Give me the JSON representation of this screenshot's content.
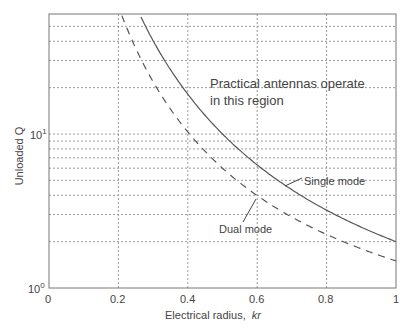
{
  "chart_data": {
    "type": "line",
    "title": "",
    "xlabel": "Electrical radius,",
    "xlabel_italic": "kr",
    "ylabel": "Unloaded Q",
    "xlim": [
      0,
      1
    ],
    "ylim": [
      1,
      60
    ],
    "yscale": "log",
    "grid": true,
    "x_ticks": [
      "0",
      "0.2",
      "0.4",
      "0.6",
      "0.8",
      "1"
    ],
    "y_ticks": [
      {
        "base": "10",
        "exp": "0"
      },
      {
        "base": "10",
        "exp": "1"
      }
    ],
    "series": [
      {
        "name": "Single mode",
        "style": "solid",
        "x": [
          0.21,
          0.25,
          0.3,
          0.35,
          0.4,
          0.45,
          0.5,
          0.6,
          0.7,
          0.8,
          0.9,
          1.0
        ],
        "values": [
          60.0,
          68.0,
          40.4,
          26.2,
          18.1,
          13.2,
          10.0,
          6.3,
          4.34,
          3.2,
          2.48,
          2.0
        ]
      },
      {
        "name": "Dual mode",
        "style": "dashed",
        "x": [
          0.19,
          0.2,
          0.25,
          0.3,
          0.35,
          0.4,
          0.45,
          0.5,
          0.6,
          0.7,
          0.8,
          0.9,
          1.0
        ],
        "values": [
          78.0,
          67.5,
          36.0,
          21.9,
          14.5,
          10.3,
          7.7,
          6.0,
          3.98,
          2.89,
          2.23,
          1.8,
          1.5
        ]
      }
    ],
    "annotations": [
      {
        "text": "Practical antennas operate",
        "line2": "in this region"
      },
      {
        "text": "Single mode",
        "arrow_to": [
          0.67,
          4.7
        ]
      },
      {
        "text": "Dual mode",
        "arrow_to": [
          0.6,
          4.0
        ]
      }
    ]
  },
  "labels": {
    "region_line1": "Practical antennas operate",
    "region_line2": "in this region",
    "single": "Single mode",
    "dual": "Dual mode",
    "xlabel": "Electrical radius,",
    "xlabel_kr": "kr",
    "ylabel": "Unloaded Q",
    "x0": "0",
    "x1": "0.2",
    "x2": "0.4",
    "x3": "0.6",
    "x4": "0.8",
    "x5": "1",
    "y_base": "10",
    "y_exp0": "0",
    "y_exp1": "1"
  }
}
